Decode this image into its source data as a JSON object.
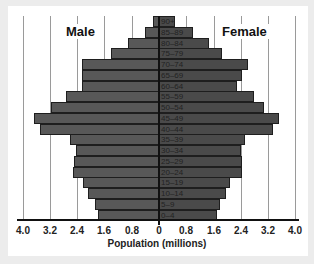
{
  "chart_data": {
    "type": "bar",
    "orientation": "horizontal",
    "subtype": "population-pyramid",
    "title": "",
    "xlabel": "Population (millions)",
    "ylabel": "",
    "xlim": [
      -4.0,
      4.0
    ],
    "x_ticks": [
      "4.0",
      "3.2",
      "2.4",
      "1.6",
      "0.8",
      "0",
      "0.8",
      "1.6",
      "2.4",
      "3.2",
      "4.0"
    ],
    "grid": "vertical",
    "categories": [
      "90+",
      "85–89",
      "80–84",
      "75–79",
      "70–74",
      "65–69",
      "60–64",
      "55–59",
      "50–54",
      "45–49",
      "40–44",
      "35–39",
      "30–34",
      "25–29",
      "20–24",
      "15–19",
      "10–14",
      "5–9",
      "0–4"
    ],
    "series": [
      {
        "name": "Male",
        "side": "left",
        "values": [
          0.18,
          0.41,
          0.91,
          1.41,
          2.26,
          2.26,
          2.26,
          2.72,
          3.16,
          3.66,
          3.49,
          2.61,
          2.43,
          2.49,
          2.52,
          2.23,
          2.08,
          1.88,
          1.79
        ]
      },
      {
        "name": "Female",
        "side": "right",
        "values": [
          0.47,
          1.0,
          1.47,
          1.85,
          2.61,
          2.43,
          2.29,
          2.79,
          3.08,
          3.52,
          3.34,
          2.52,
          2.4,
          2.43,
          2.43,
          2.08,
          1.96,
          1.79,
          1.7
        ]
      }
    ],
    "legend": {
      "left_label": "Male",
      "right_label": "Female",
      "position": "top"
    },
    "colors": {
      "bar": "#585858",
      "bar_border": "#1e1e1e",
      "grid": "#9a9a9a"
    }
  }
}
